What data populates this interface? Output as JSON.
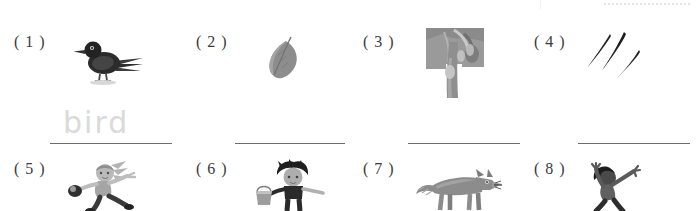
{
  "page": {
    "type": "picture-vocabulary-worksheet",
    "background_color": "#ffffff",
    "rule_color": "#6d6d6d",
    "answer_ink_color": "#dadada",
    "label_color": "#3a3a3a"
  },
  "decorations": {
    "top_dotted_rule": "dotted-rule",
    "top_faint_vertical_rule": "faint-vertical-rule"
  },
  "rows": [
    {
      "row_index": 1,
      "items": [
        {
          "number_label": "( 1 )",
          "picture_name": "bird-illustration",
          "picture_caption": "bird",
          "answer_value": "bird",
          "answer_line": "answer-line-1"
        },
        {
          "number_label": "( 2 )",
          "picture_name": "leaf-illustration",
          "picture_caption": "leaf",
          "answer_value": "",
          "answer_line": "answer-line-2"
        },
        {
          "number_label": "( 3 )",
          "picture_name": "tree-photo",
          "picture_caption": "tree",
          "answer_value": "",
          "answer_line": "answer-line-3"
        },
        {
          "number_label": "( 4 )",
          "picture_name": "grass-blades-illustration",
          "picture_caption": "grass",
          "answer_value": "",
          "answer_line": "answer-line-4"
        }
      ]
    },
    {
      "row_index": 2,
      "items": [
        {
          "number_label": "( 5 )",
          "picture_name": "girl-catching-ball-illustration",
          "picture_caption": "catch",
          "answer_value": ""
        },
        {
          "number_label": "( 6 )",
          "picture_name": "boy-with-bucket-illustration",
          "picture_caption": "bucket",
          "answer_value": ""
        },
        {
          "number_label": "( 7 )",
          "picture_name": "wolf-illustration",
          "picture_caption": "wolf",
          "answer_value": ""
        },
        {
          "number_label": "( 8 )",
          "picture_name": "jumping-person-illustration",
          "picture_caption": "jump",
          "answer_value": ""
        }
      ]
    }
  ]
}
